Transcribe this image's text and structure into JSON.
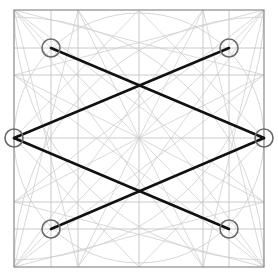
{
  "diagram": {
    "type": "geometric-construction",
    "frame": {
      "x1": 14,
      "y1": 10,
      "x2": 264,
      "y2": 267
    },
    "center": {
      "x": 139,
      "y": 138
    },
    "grid": {
      "verticals": [
        51,
        78,
        139,
        203,
        229
      ],
      "horizontals": [
        48,
        75,
        138,
        202,
        229
      ]
    },
    "large_circle": {
      "cx": 139,
      "cy": 138,
      "r": 125
    },
    "corner_arcs_radius": 250,
    "marker_points": [
      {
        "id": "top-left",
        "x": 51,
        "y": 48
      },
      {
        "id": "top-right",
        "x": 229,
        "y": 48
      },
      {
        "id": "left-mid",
        "x": 14,
        "y": 138
      },
      {
        "id": "right-mid",
        "x": 264,
        "y": 138
      },
      {
        "id": "bottom-left",
        "x": 51,
        "y": 229
      },
      {
        "id": "bottom-right",
        "x": 229,
        "y": 229
      }
    ],
    "marker_radius": 9,
    "bold_path": [
      [
        "top-left",
        "right-mid"
      ],
      [
        "right-mid",
        "bottom-left"
      ],
      [
        "top-right",
        "left-mid"
      ],
      [
        "left-mid",
        "bottom-right"
      ]
    ],
    "colors": {
      "bold_line": "#111111",
      "marker": "#6a6a6a",
      "frame": "#8a8a8a",
      "guide": "#cfcfcf"
    }
  }
}
